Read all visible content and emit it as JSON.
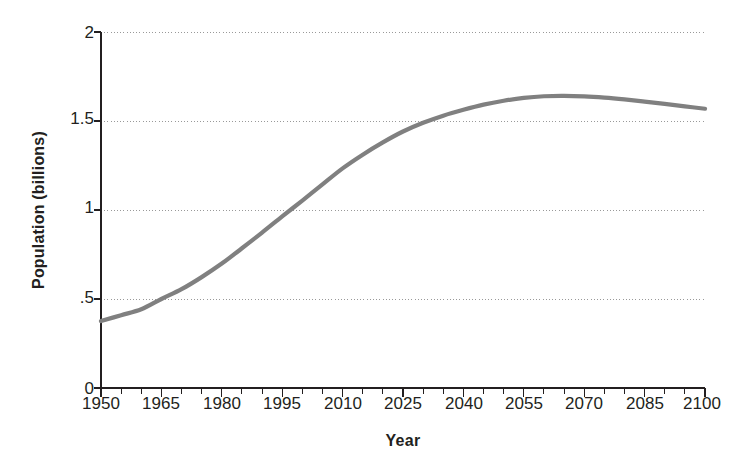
{
  "chart_data": {
    "type": "line",
    "title": "",
    "xlabel": "Year",
    "ylabel": "Population (billions)",
    "xlim": [
      1950,
      2100
    ],
    "ylim": [
      0,
      2
    ],
    "grid": true,
    "grid_axis": "y",
    "legend": "none",
    "line_color": "#808080",
    "axis_color": "#231f20",
    "gridline_color": "#999999",
    "x_tick_labels": [
      "1950",
      "1965",
      "1980",
      "1995",
      "2010",
      "2025",
      "2040",
      "2055",
      "2070",
      "2085",
      "2100"
    ],
    "x_tick_values": [
      1950,
      1965,
      1980,
      1995,
      2010,
      2025,
      2040,
      2055,
      2070,
      2085,
      2100
    ],
    "x_minor_tick_step": 5,
    "y_tick_labels": [
      "0",
      ".5",
      "1",
      "1.5",
      "2"
    ],
    "y_tick_values": [
      0,
      0.5,
      1,
      1.5,
      2
    ],
    "series": [
      {
        "name": "Population",
        "x": [
          1950,
          1955,
          1960,
          1965,
          1970,
          1975,
          1980,
          1985,
          1990,
          1995,
          2000,
          2005,
          2010,
          2015,
          2020,
          2025,
          2030,
          2035,
          2040,
          2045,
          2050,
          2055,
          2060,
          2065,
          2070,
          2075,
          2080,
          2085,
          2090,
          2095,
          2100
        ],
        "values": [
          0.376,
          0.409,
          0.442,
          0.5,
          0.555,
          0.623,
          0.699,
          0.785,
          0.873,
          0.964,
          1.053,
          1.144,
          1.234,
          1.311,
          1.38,
          1.441,
          1.49,
          1.53,
          1.563,
          1.592,
          1.614,
          1.63,
          1.639,
          1.641,
          1.638,
          1.631,
          1.621,
          1.609,
          1.596,
          1.582,
          1.569
        ]
      }
    ]
  }
}
